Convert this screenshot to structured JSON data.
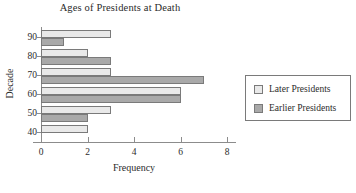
{
  "chart_data": {
    "type": "bar",
    "orientation": "horizontal",
    "title": "Ages of Presidents at Death",
    "xlabel": "Frequency",
    "ylabel": "Decade",
    "categories": [
      "90",
      "80",
      "70",
      "60",
      "50",
      "40"
    ],
    "series": [
      {
        "name": "Later Presidents",
        "color": "#e9e9e9",
        "values": [
          3,
          2,
          3,
          6,
          3,
          2
        ]
      },
      {
        "name": "Earlier Presidents",
        "color": "#a9a9a9",
        "values": [
          1,
          3,
          7,
          6,
          2,
          0
        ]
      }
    ],
    "xlim": [
      0,
      8
    ],
    "xticks": [
      "0",
      "2",
      "4",
      "6",
      "8"
    ],
    "xtick_values": [
      0,
      2,
      4,
      6,
      8
    ],
    "grid": false,
    "legend_position": "right"
  },
  "legend": {
    "entries": [
      {
        "label": "Later Presidents"
      },
      {
        "label": "Earlier Presidents"
      }
    ]
  }
}
